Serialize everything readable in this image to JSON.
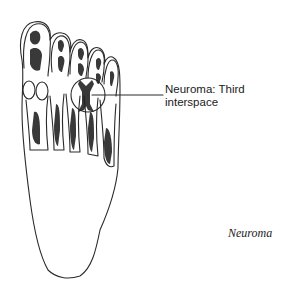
{
  "figure": {
    "annotation": {
      "line1": "Neuroma: Third",
      "line2": "interspace"
    },
    "caption": "Neuroma",
    "colors": {
      "outline": "#2a2a2a",
      "shading": "#1e1e1e",
      "background": "#ffffff"
    }
  }
}
